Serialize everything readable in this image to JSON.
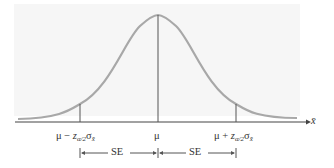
{
  "diagram": {
    "type": "normal-distribution-confidence-interval",
    "axis_label": "x̄",
    "center_label": "μ",
    "left_label": {
      "prefix": "μ − ",
      "z": "z",
      "z_sub": "α/2",
      "sigma": "σ",
      "sigma_sub": "x̄"
    },
    "right_label": {
      "prefix": "μ + ",
      "z": "z",
      "z_sub": "α/2",
      "sigma": "σ",
      "sigma_sub": "x̄"
    },
    "brackets": [
      {
        "label": "SE"
      },
      {
        "label": "SE"
      }
    ],
    "colors": {
      "curve": "#a8a8a8",
      "axis": "#444444",
      "lines": "#555555",
      "background_box": "#f6f6f6"
    }
  }
}
